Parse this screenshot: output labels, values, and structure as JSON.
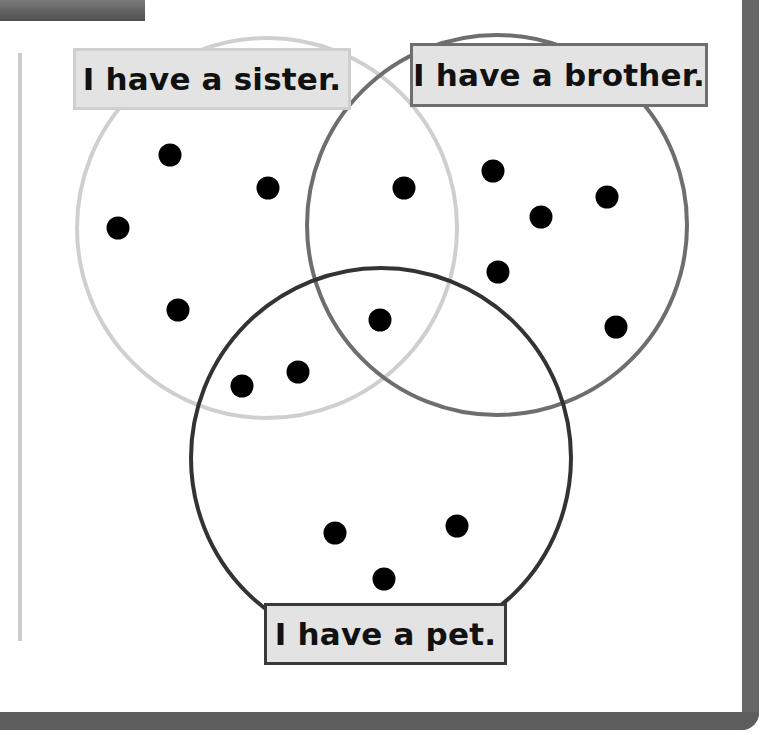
{
  "colors": {
    "sister_circle": "#cfcfcf",
    "brother_circle": "#6e6e6e",
    "pet_circle": "#333333",
    "label_fill": "#e3e3e3",
    "dot": "#000000",
    "frame": "#626262"
  },
  "venn": {
    "sets": [
      {
        "id": "sister",
        "label": "I have a sister.",
        "cx": 267,
        "cy": 228,
        "r": 190
      },
      {
        "id": "brother",
        "label": "I have a brother.",
        "cx": 497,
        "cy": 225,
        "r": 190
      },
      {
        "id": "pet",
        "label": "I have a pet.",
        "cx": 381,
        "cy": 458,
        "r": 190
      }
    ],
    "regions": {
      "sister_only": 4,
      "brother_only": 5,
      "pet_only": 3,
      "sister_and_brother_only": 1,
      "sister_and_pet_only": 2,
      "brother_and_pet_only": 0,
      "all_three": 1
    },
    "dots": [
      {
        "x": 170,
        "y": 155,
        "region": "sister_only"
      },
      {
        "x": 268,
        "y": 188,
        "region": "sister_only"
      },
      {
        "x": 118,
        "y": 228,
        "region": "sister_only"
      },
      {
        "x": 178,
        "y": 310,
        "region": "sister_only"
      },
      {
        "x": 404,
        "y": 188,
        "region": "sister_and_brother_only"
      },
      {
        "x": 493,
        "y": 171,
        "region": "brother_only"
      },
      {
        "x": 607,
        "y": 197,
        "region": "brother_only"
      },
      {
        "x": 541,
        "y": 217,
        "region": "brother_only"
      },
      {
        "x": 498,
        "y": 272,
        "region": "brother_only"
      },
      {
        "x": 616,
        "y": 327,
        "region": "brother_only"
      },
      {
        "x": 380,
        "y": 320,
        "region": "all_three"
      },
      {
        "x": 298,
        "y": 372,
        "region": "sister_and_pet_only"
      },
      {
        "x": 242,
        "y": 386,
        "region": "sister_and_pet_only"
      },
      {
        "x": 335,
        "y": 533,
        "region": "pet_only"
      },
      {
        "x": 457,
        "y": 526,
        "region": "pet_only"
      },
      {
        "x": 384,
        "y": 579,
        "region": "pet_only"
      }
    ],
    "total_dots": 16
  },
  "labels": {
    "sister": "I have a sister.",
    "brother": "I have a brother.",
    "pet": "I have a pet."
  }
}
